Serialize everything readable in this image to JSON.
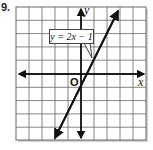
{
  "problem": {
    "number": "9."
  },
  "graph": {
    "equation_label": "y = 2x − 1",
    "x_axis_label": "x",
    "y_axis_label": "y",
    "origin_label": "O",
    "grid": {
      "columns": 10,
      "rows": 10
    },
    "line": {
      "slope": 2,
      "intercept": -1
    },
    "colors": {
      "grid": "#666666",
      "axis": "#111111",
      "line": "#111111",
      "shadow": "#bbbbbb"
    }
  }
}
